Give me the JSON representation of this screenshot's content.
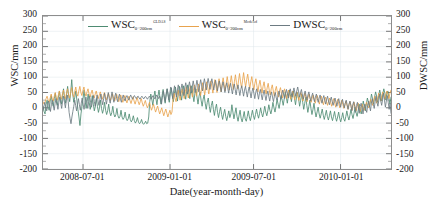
{
  "chart_data": {
    "type": "line",
    "title": "",
    "xlabel": "Date(year-month-day)",
    "ylabel": "WSC/mm",
    "ylabel_right": "DWSC/mm",
    "ylim": [
      -200,
      300
    ],
    "ytick_labels": [
      "300",
      "250",
      "200",
      "150",
      "100",
      "50",
      "0",
      "-50",
      "-100",
      "-150",
      "-200"
    ],
    "ytick_values": [
      300,
      250,
      200,
      150,
      100,
      50,
      0,
      -50,
      -100,
      -150,
      -200
    ],
    "ytick_labels_right": [
      "300",
      "250",
      "200",
      "150",
      "100",
      "50",
      "0",
      "-50",
      "-100",
      "-150",
      "-200"
    ],
    "xtick_labels": [
      "2008-07-01",
      "2009-01-01",
      "2009-07-01",
      "2010-01-01"
    ],
    "xtick_positions": [
      0.115,
      0.365,
      0.605,
      0.855
    ],
    "xlim": [
      "2008-04-15",
      "2010-04-15"
    ],
    "grid": true,
    "legend_position": "top-center",
    "series": [
      {
        "name": "WSC 0~200cm GLDAS",
        "label_base": "WSC",
        "label_sub": "0~200cm",
        "label_sup": "GLDAS",
        "color": "#4e8b72",
        "values": [
          5,
          -12,
          -20,
          10,
          25,
          5,
          -8,
          22,
          40,
          18,
          5,
          30,
          48,
          20,
          8,
          35,
          55,
          28,
          12,
          40,
          62,
          30,
          15,
          45,
          70,
          38,
          20,
          52,
          92,
          45,
          18,
          35,
          55,
          25,
          -5,
          -30,
          -58,
          -20,
          5,
          30,
          58,
          25,
          -2,
          20,
          45,
          18,
          -5,
          15,
          40,
          12,
          -10,
          5,
          30,
          5,
          -15,
          0,
          25,
          -2,
          -18,
          -5,
          18,
          -8,
          -22,
          -10,
          12,
          -14,
          -26,
          -16,
          5,
          -20,
          -30,
          -22,
          -2,
          -26,
          -34,
          -28,
          -8,
          -30,
          -38,
          -32,
          -14,
          -34,
          -42,
          -36,
          -20,
          -38,
          -46,
          -40,
          -26,
          -42,
          -50,
          -44,
          -32,
          -46,
          -52,
          -48,
          -38,
          -50,
          -54,
          -50,
          -44,
          -52,
          -50,
          -30,
          20,
          45,
          28,
          8,
          35,
          55,
          30,
          10,
          38,
          58,
          32,
          12,
          40,
          60,
          35,
          15,
          42,
          62,
          38,
          18,
          45,
          65,
          40,
          20,
          48,
          68,
          42,
          22,
          50,
          70,
          45,
          25,
          52,
          72,
          48,
          28,
          55,
          75,
          50,
          30,
          58,
          72,
          42,
          20,
          48,
          62,
          35,
          12,
          38,
          52,
          25,
          5,
          28,
          42,
          15,
          -5,
          18,
          32,
          5,
          -15,
          8,
          22,
          -5,
          -25,
          -2,
          12,
          -15,
          -32,
          -12,
          2,
          -22,
          -38,
          -20,
          -5,
          -28,
          -42,
          -26,
          -10,
          -32,
          -20,
          10,
          -14,
          -36,
          -18,
          0,
          -28,
          -44,
          -24,
          -8,
          -34,
          -46,
          -30,
          -12,
          -36,
          -44,
          -28,
          -10,
          -30,
          -42,
          -26,
          -8,
          -26,
          -38,
          -22,
          -4,
          -22,
          -34,
          -18,
          0,
          -18,
          -30,
          -14,
          5,
          -14,
          -26,
          -10,
          10,
          -8,
          -20,
          -4,
          18,
          0,
          -14,
          5,
          28,
          12,
          -2,
          18,
          40,
          25,
          8,
          30,
          52,
          35,
          15,
          38,
          58,
          42,
          20,
          45,
          55,
          30,
          10,
          35,
          50,
          28,
          5,
          25,
          45,
          18,
          -5,
          15,
          35,
          8,
          -15,
          5,
          25,
          -2,
          -22,
          -5,
          15,
          -12,
          -30,
          -14,
          2,
          -20,
          -34,
          -20,
          -4,
          -24,
          -38,
          -24,
          -8,
          -28,
          -40,
          -26,
          -10,
          -30,
          -42,
          -28,
          -12,
          -32,
          -44,
          -30,
          -14,
          -34,
          -46,
          -32,
          -16,
          -36,
          -44,
          -28,
          -10,
          -28,
          -40,
          -24,
          -5,
          -22,
          -35,
          -18,
          2,
          -16,
          -28,
          -10,
          12,
          -8,
          -20,
          0,
          22,
          5,
          -10,
          12,
          32,
          18,
          2,
          22,
          45,
          30,
          12,
          35,
          52,
          38,
          18,
          40,
          58,
          42,
          22,
          45,
          62,
          48,
          25,
          50,
          55,
          30,
          12,
          35
        ]
      },
      {
        "name": "WSC 0~200cm Modeled",
        "label_base": "WSC",
        "label_sub": "0~200cm",
        "label_sup": "Modeled",
        "color": "#e8a34e",
        "values": [
          20,
          12,
          18,
          30,
          38,
          25,
          18,
          32,
          45,
          30,
          22,
          38,
          50,
          32,
          25,
          42,
          55,
          35,
          28,
          45,
          58,
          38,
          30,
          48,
          62,
          42,
          32,
          50,
          66,
          45,
          35,
          52,
          68,
          48,
          38,
          55,
          70,
          50,
          40,
          56,
          68,
          48,
          38,
          52,
          62,
          45,
          35,
          48,
          58,
          42,
          32,
          45,
          55,
          40,
          30,
          42,
          52,
          38,
          28,
          40,
          50,
          36,
          26,
          38,
          48,
          34,
          24,
          36,
          46,
          32,
          22,
          34,
          44,
          30,
          20,
          32,
          42,
          28,
          18,
          30,
          40,
          26,
          16,
          28,
          38,
          24,
          14,
          26,
          36,
          22,
          12,
          24,
          34,
          20,
          10,
          20,
          30,
          16,
          5,
          14,
          24,
          10,
          0,
          8,
          18,
          4,
          -8,
          2,
          12,
          -2,
          -14,
          -4,
          6,
          -8,
          -20,
          -10,
          0,
          -14,
          -26,
          -14,
          -4,
          -18,
          -30,
          -18,
          -8,
          -22,
          -14,
          25,
          48,
          32,
          20,
          42,
          58,
          40,
          25,
          48,
          62,
          45,
          30,
          52,
          68,
          48,
          32,
          55,
          72,
          52,
          35,
          58,
          75,
          55,
          38,
          62,
          78,
          58,
          40,
          65,
          82,
          62,
          42,
          68,
          85,
          65,
          45,
          70,
          88,
          68,
          48,
          72,
          92,
          70,
          50,
          75,
          95,
          72,
          52,
          78,
          98,
          75,
          55,
          80,
          102,
          78,
          58,
          82,
          105,
          80,
          60,
          85,
          108,
          82,
          62,
          88,
          112,
          85,
          65,
          90,
          115,
          88,
          68,
          92,
          110,
          85,
          62,
          85,
          102,
          78,
          58,
          80,
          95,
          72,
          52,
          75,
          90,
          68,
          48,
          70,
          85,
          62,
          45,
          65,
          80,
          58,
          42,
          62,
          75,
          55,
          38,
          58,
          70,
          50,
          35,
          55,
          66,
          48,
          32,
          50,
          62,
          45,
          30,
          48,
          58,
          42,
          28,
          45,
          55,
          40,
          26,
          42,
          52,
          38,
          24,
          40,
          50,
          35,
          22,
          38,
          48,
          32,
          20,
          35,
          45,
          30,
          18,
          32,
          42,
          28,
          15,
          30,
          40,
          25,
          12,
          28,
          38,
          22,
          10,
          25,
          35,
          20,
          8,
          22,
          32,
          18,
          5,
          20,
          30,
          15,
          2,
          18,
          28,
          12,
          0,
          15,
          25,
          10,
          -2,
          12,
          22,
          8,
          -5,
          10,
          20,
          5,
          -8,
          8,
          18,
          2,
          -10,
          5,
          15,
          0,
          -12,
          2,
          12,
          -2,
          -8,
          5,
          18,
          8,
          0,
          12,
          28,
          18,
          8,
          22,
          38,
          28,
          15,
          32,
          48,
          35,
          22,
          40,
          52,
          40,
          28,
          45,
          55,
          42,
          30,
          48,
          58
        ]
      },
      {
        "name": "DWSC 0~200cm",
        "label_base": "DWSC",
        "label_sub": "0~200cm",
        "label_sup": "",
        "color": "#6d7b82",
        "values": [
          -8,
          5,
          18,
          2,
          -10,
          8,
          22,
          5,
          -12,
          10,
          25,
          8,
          -8,
          15,
          30,
          12,
          -5,
          18,
          35,
          15,
          -2,
          22,
          38,
          18,
          0,
          25,
          42,
          20,
          -15,
          -35,
          -52,
          -30,
          -12,
          5,
          25,
          8,
          -10,
          12,
          30,
          10,
          -8,
          15,
          32,
          12,
          -5,
          18,
          35,
          15,
          -2,
          20,
          38,
          18,
          2,
          22,
          40,
          20,
          5,
          25,
          42,
          22,
          8,
          28,
          45,
          25,
          10,
          30,
          48,
          28,
          12,
          32,
          50,
          30,
          15,
          35,
          52,
          32,
          18,
          38,
          48,
          30,
          20,
          35,
          45,
          28,
          18,
          32,
          42,
          30,
          22,
          35,
          40,
          32,
          25,
          35,
          42,
          34,
          28,
          36,
          40,
          34,
          30,
          36,
          38,
          32,
          28,
          34,
          38,
          33,
          29,
          35,
          37,
          32,
          28,
          34,
          38,
          33,
          28,
          35,
          40,
          34,
          29,
          36,
          42,
          35,
          30,
          38,
          30,
          12,
          35,
          55,
          38,
          20,
          45,
          62,
          45,
          25,
          50,
          68,
          50,
          30,
          55,
          72,
          55,
          35,
          58,
          75,
          58,
          38,
          62,
          78,
          60,
          40,
          65,
          82,
          65,
          45,
          68,
          85,
          68,
          48,
          70,
          88,
          70,
          50,
          72,
          90,
          72,
          52,
          75,
          92,
          75,
          55,
          78,
          95,
          78,
          58,
          80,
          96,
          80,
          60,
          82,
          95,
          78,
          58,
          78,
          90,
          72,
          55,
          75,
          88,
          70,
          52,
          72,
          85,
          68,
          50,
          70,
          82,
          65,
          48,
          68,
          80,
          62,
          45,
          65,
          78,
          60,
          42,
          62,
          75,
          58,
          40,
          60,
          72,
          55,
          38,
          58,
          70,
          52,
          35,
          55,
          68,
          50,
          32,
          52,
          65,
          48,
          30,
          50,
          62,
          45,
          28,
          48,
          60,
          42,
          26,
          45,
          58,
          40,
          24,
          42,
          55,
          38,
          22,
          40,
          52,
          35,
          20,
          38,
          50,
          32,
          25,
          42,
          55,
          38,
          28,
          45,
          58,
          42,
          30,
          48,
          60,
          45,
          32,
          50,
          62,
          48,
          35,
          52,
          65,
          50,
          38,
          55,
          68,
          52,
          35,
          50,
          60,
          42,
          28,
          45,
          55,
          38,
          25,
          42,
          52,
          35,
          22,
          38,
          48,
          32,
          20,
          35,
          45,
          30,
          18,
          32,
          42,
          28,
          15,
          30,
          40,
          25,
          12,
          28,
          38,
          22,
          10,
          25,
          35,
          20,
          8,
          22,
          32,
          18,
          5,
          20,
          30,
          15,
          2,
          18,
          28,
          12,
          0,
          15,
          25,
          10,
          -5,
          12,
          22,
          8,
          -10,
          10,
          20,
          5,
          -15,
          8,
          18,
          2,
          -18,
          5,
          15,
          0,
          -20,
          2,
          12,
          -5,
          -15,
          8,
          22,
          5,
          -10,
          15,
          30,
          12,
          -2,
          20,
          38,
          18,
          5,
          25,
          45,
          22,
          8,
          28,
          48,
          25,
          2,
          22,
          40,
          18,
          -5,
          15,
          -18
        ]
      }
    ]
  }
}
